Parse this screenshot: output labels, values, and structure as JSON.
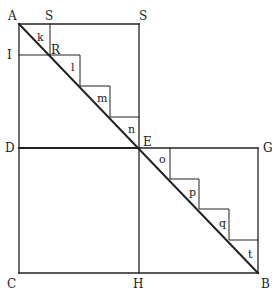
{
  "diagram": {
    "type": "geometric-figure",
    "points": {
      "A": "A",
      "S1": "S",
      "S2": "S",
      "I": "I",
      "R": "R",
      "D": "D",
      "E": "E",
      "G": "G",
      "C": "C",
      "H": "H",
      "B": "B"
    },
    "triangles_top": [
      "k",
      "l",
      "m",
      "n"
    ],
    "triangles_bottom": [
      "o",
      "p",
      "q",
      "t"
    ],
    "colors": {
      "line": "#222222",
      "background": "#ffffff"
    }
  }
}
